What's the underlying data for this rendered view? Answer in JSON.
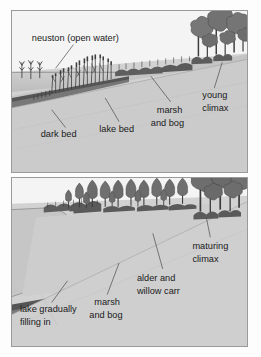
{
  "figure": {
    "panel_count": 2,
    "colors": {
      "sky": "#f2f2f2",
      "water": "#c9c9c9",
      "land": "#cfcfcf",
      "dark_bed": "#4a4a4a",
      "vegetation": "#6b6b6b",
      "tree": "#7a7a7a",
      "label_text": "#1a1a1a",
      "frame": "#9a9a9a",
      "leader_line": "#4a4a4a"
    }
  },
  "panels": [
    {
      "id": "panel-top",
      "name": "early-succession-stage",
      "stage": "young climax",
      "labels": [
        {
          "id": "neuston",
          "text": "neuston (open water)",
          "lines": [
            "neuston (open water)"
          ]
        },
        {
          "id": "dark-bed",
          "text": "dark bed",
          "lines": [
            "dark bed"
          ]
        },
        {
          "id": "lake-bed",
          "text": "lake bed",
          "lines": [
            "lake bed"
          ]
        },
        {
          "id": "marsh-bog",
          "text": "marsh and bog",
          "lines": [
            "marsh",
            "and bog"
          ]
        },
        {
          "id": "young-climax",
          "text": "young climax",
          "lines": [
            "young",
            "climax"
          ]
        }
      ]
    },
    {
      "id": "panel-bottom",
      "name": "late-succession-stage",
      "stage": "maturing climax",
      "labels": [
        {
          "id": "lake-filling",
          "text": "lake gradually filling in",
          "lines": [
            "lake gradually",
            "filling in"
          ]
        },
        {
          "id": "marsh-bog-2",
          "text": "marsh and bog",
          "lines": [
            "marsh",
            "and bog"
          ]
        },
        {
          "id": "alder-willow",
          "text": "alder and willow carr",
          "lines": [
            "alder and",
            "willow carr"
          ]
        },
        {
          "id": "maturing-climax",
          "text": "maturing climax",
          "lines": [
            "maturing",
            "climax"
          ]
        }
      ]
    }
  ]
}
